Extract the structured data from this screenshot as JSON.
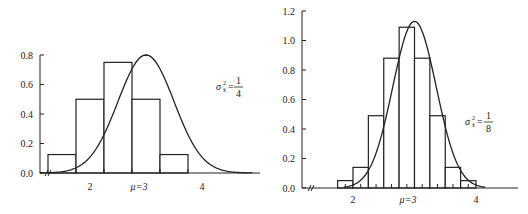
{
  "chart_data": [
    {
      "type": "bar",
      "subtype": "histogram-with-normal-curve",
      "title": "",
      "xlabel": "",
      "ylabel": "",
      "ylim": [
        0,
        0.8
      ],
      "yticks": [
        "0.0",
        "0.2",
        "0.4",
        "0.6",
        "0.8"
      ],
      "xtick_labels": [
        "2",
        "μ=3",
        "4"
      ],
      "axis_break": true,
      "grid": false,
      "annotation": {
        "text": "σ",
        "sup": "2",
        "sub": "x̄",
        "eq": "=",
        "num": "1",
        "den": "4"
      },
      "bin_edges": [
        1.25,
        1.75,
        2.25,
        2.75,
        3.25,
        3.75
      ],
      "values": [
        0.125,
        0.5,
        0.75,
        0.5,
        0.125
      ],
      "curve": {
        "type": "normal",
        "mean": 3,
        "variance": 0.25,
        "peak": 0.8
      }
    },
    {
      "type": "bar",
      "subtype": "histogram-with-normal-curve",
      "title": "",
      "xlabel": "",
      "ylabel": "",
      "ylim": [
        0,
        1.2
      ],
      "yticks": [
        "0.0",
        "0.2",
        "0.4",
        "0.6",
        "0.8",
        "1.0",
        "1.2"
      ],
      "xtick_labels": [
        "2",
        "μ=3",
        "4"
      ],
      "axis_break": true,
      "grid": false,
      "annotation": {
        "text": "σ",
        "sup": "2",
        "sub": "x̄",
        "eq": "=",
        "num": "1",
        "den": "8"
      },
      "bin_edges": [
        1.75,
        2.0,
        2.25,
        2.5,
        2.75,
        3.0,
        3.25,
        3.5,
        3.75,
        4.0
      ],
      "values": [
        0.05,
        0.14,
        0.49,
        0.88,
        1.09,
        0.88,
        0.49,
        0.14,
        0.05
      ],
      "curve": {
        "type": "normal",
        "mean": 3,
        "variance": 0.125,
        "peak": 1.13
      }
    }
  ]
}
